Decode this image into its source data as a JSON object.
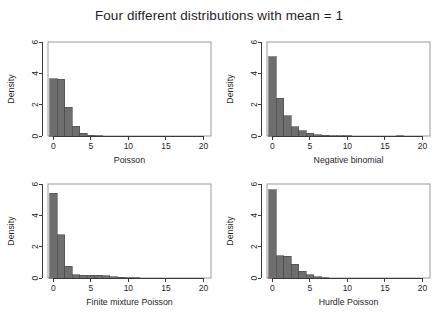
{
  "figure": {
    "title": "Four different distributions with mean = 1",
    "background": "#ffffff",
    "bar_fill": "#6e6e6e",
    "bar_stroke": "#4a4a4a",
    "frame_color": "#9a9a9a"
  },
  "chart_data": [
    {
      "type": "bar",
      "title": "",
      "xlabel": "Poisson",
      "ylabel": "Density",
      "xlim": [
        -0.7,
        21.0
      ],
      "ylim": [
        0,
        6
      ],
      "xticks": [
        0,
        5,
        10,
        15,
        20
      ],
      "yticks": [
        0,
        2,
        4,
        6
      ],
      "grid": false,
      "legend": "none",
      "bin_width": 1,
      "categories": [
        0,
        1,
        2,
        3,
        4,
        5,
        6,
        7,
        8,
        9,
        10
      ],
      "values": [
        3.67,
        3.63,
        1.85,
        0.62,
        0.16,
        0.04,
        0.01,
        0.0,
        0.0,
        0.0,
        0.0
      ]
    },
    {
      "type": "bar",
      "title": "",
      "xlabel": "Negative binomial",
      "ylabel": "Density",
      "xlim": [
        -0.7,
        21.0
      ],
      "ylim": [
        0,
        6
      ],
      "xticks": [
        0,
        5,
        10,
        15,
        20
      ],
      "yticks": [
        0,
        2,
        4,
        6
      ],
      "grid": false,
      "legend": "none",
      "bin_width": 1,
      "categories": [
        0,
        1,
        2,
        3,
        4,
        5,
        6,
        7,
        8,
        9,
        10,
        11,
        12,
        13,
        14,
        15,
        16,
        17
      ],
      "values": [
        5.05,
        2.42,
        1.28,
        0.6,
        0.33,
        0.16,
        0.09,
        0.05,
        0.02,
        0.01,
        0.01,
        0.0,
        0.0,
        0.0,
        0.0,
        0.0,
        0.0,
        0.02
      ]
    },
    {
      "type": "bar",
      "title": "",
      "xlabel": "Finite mixture Poisson",
      "ylabel": "Density",
      "xlim": [
        -0.7,
        21.0
      ],
      "ylim": [
        0,
        6
      ],
      "xticks": [
        0,
        5,
        10,
        15,
        20
      ],
      "yticks": [
        0,
        2,
        4,
        6
      ],
      "grid": false,
      "legend": "none",
      "bin_width": 1,
      "categories": [
        0,
        1,
        2,
        3,
        4,
        5,
        6,
        7,
        8,
        9,
        10,
        11,
        12
      ],
      "values": [
        5.42,
        2.75,
        0.75,
        0.22,
        0.17,
        0.19,
        0.17,
        0.14,
        0.09,
        0.05,
        0.03,
        0.01,
        0.0
      ]
    },
    {
      "type": "bar",
      "title": "",
      "xlabel": "Hurdle Poisson",
      "ylabel": "Density",
      "xlim": [
        -0.7,
        21.0
      ],
      "ylim": [
        0,
        6
      ],
      "xticks": [
        0,
        5,
        10,
        15,
        20
      ],
      "yticks": [
        0,
        2,
        4,
        6
      ],
      "grid": false,
      "legend": "none",
      "bin_width": 1,
      "categories": [
        0,
        1,
        2,
        3,
        4,
        5,
        6,
        7,
        8,
        9
      ],
      "values": [
        5.62,
        1.42,
        1.4,
        0.88,
        0.44,
        0.22,
        0.07,
        0.02,
        0.0,
        0.0
      ]
    }
  ]
}
